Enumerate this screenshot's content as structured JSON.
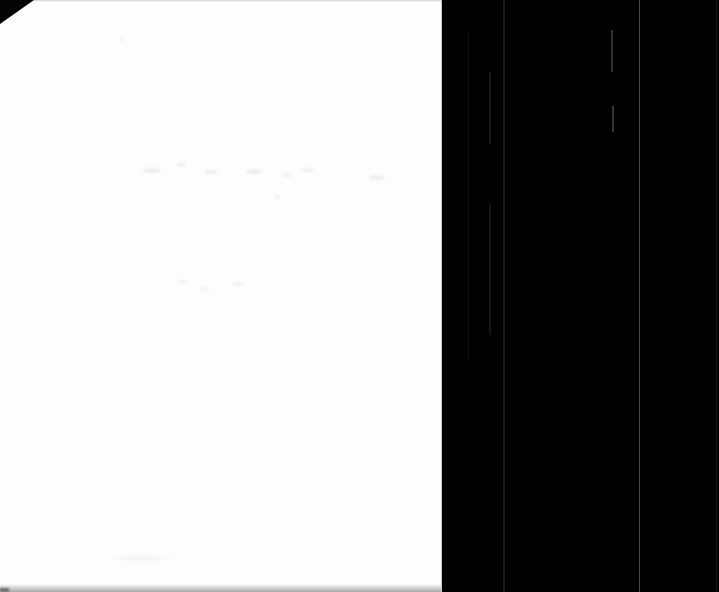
{
  "meta": {
    "type": "book-scan-photo",
    "visible_text": ""
  },
  "colors": {
    "page_white": "#fdfdfd",
    "background_black": "#010101",
    "corner_fold": "#050505",
    "page_edge_light": "#c8c8c8",
    "bottom_shadow": "#a8a8a8",
    "full_height_streak": "#4a4a4a",
    "secondary_streak": "#1c1c1c"
  },
  "geometry": {
    "image": {
      "width": 719,
      "height": 592
    },
    "page": {
      "left": 0,
      "top": 0,
      "width": 441,
      "height": 592
    },
    "panel": {
      "left": 442,
      "top": 0,
      "width": 277,
      "height": 592
    },
    "corner_fold": {
      "width": 34,
      "height": 24
    }
  },
  "panel_streaks": [
    {
      "x": 468,
      "top": 30,
      "height": 330,
      "width": 1,
      "color": "#0e0e0e"
    },
    {
      "x": 489,
      "top": 72,
      "height": 72,
      "width": 2,
      "color": "#181818"
    },
    {
      "x": 489,
      "top": 205,
      "height": 130,
      "width": 2,
      "color": "#151515"
    },
    {
      "x": 503,
      "top": 0,
      "height": 592,
      "width": 2,
      "color": "#1c1c1c"
    },
    {
      "x": 611,
      "top": 30,
      "height": 42,
      "width": 2,
      "color": "#303030"
    },
    {
      "x": 612,
      "top": 106,
      "height": 26,
      "width": 2,
      "color": "#343434"
    },
    {
      "x": 639,
      "top": 0,
      "height": 592,
      "width": 1,
      "color": "#4a4a4a"
    },
    {
      "x": 716,
      "top": 0,
      "height": 592,
      "width": 1,
      "color": "#161616"
    }
  ],
  "page_smudges": [
    {
      "x": 143,
      "y": 168,
      "w": 18,
      "h": 5,
      "color": "#ededed"
    },
    {
      "x": 176,
      "y": 163,
      "w": 10,
      "h": 4,
      "color": "#f1f1f1"
    },
    {
      "x": 204,
      "y": 170,
      "w": 14,
      "h": 4,
      "color": "#efefef"
    },
    {
      "x": 246,
      "y": 169,
      "w": 16,
      "h": 5,
      "color": "#ededed"
    },
    {
      "x": 282,
      "y": 173,
      "w": 10,
      "h": 4,
      "color": "#f1f1f1"
    },
    {
      "x": 300,
      "y": 168,
      "w": 14,
      "h": 4,
      "color": "#f0f0f0"
    },
    {
      "x": 369,
      "y": 175,
      "w": 16,
      "h": 5,
      "color": "#eeeeee"
    },
    {
      "x": 275,
      "y": 195,
      "w": 5,
      "h": 4,
      "color": "#f0f0f0"
    },
    {
      "x": 178,
      "y": 280,
      "w": 10,
      "h": 4,
      "color": "#f3f3f3"
    },
    {
      "x": 200,
      "y": 287,
      "w": 9,
      "h": 4,
      "color": "#f2f2f2"
    },
    {
      "x": 232,
      "y": 282,
      "w": 11,
      "h": 4,
      "color": "#f2f2f2"
    },
    {
      "x": 120,
      "y": 38,
      "w": 4,
      "h": 3,
      "color": "#ececec"
    },
    {
      "x": 115,
      "y": 557,
      "w": 55,
      "h": 3,
      "color": "#f1f1f1"
    }
  ]
}
